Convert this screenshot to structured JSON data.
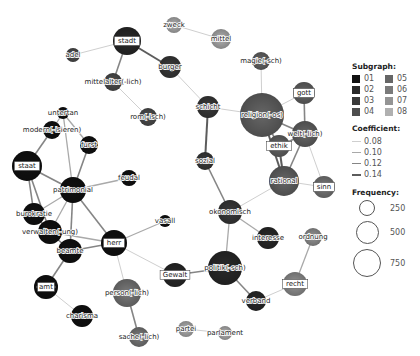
{
  "legend": {
    "subgraph_title": "Subgraph:",
    "subgraphs": [
      {
        "label": "01",
        "color": "#111111"
      },
      {
        "label": "02",
        "color": "#2a2a2a"
      },
      {
        "label": "03",
        "color": "#3a3a3a"
      },
      {
        "label": "04",
        "color": "#4e4e4e"
      },
      {
        "label": "05",
        "color": "#666666"
      },
      {
        "label": "06",
        "color": "#7a7a7a"
      },
      {
        "label": "07",
        "color": "#949494"
      },
      {
        "label": "08",
        "color": "#b0b0b0"
      }
    ],
    "coefficient_title": "Coefficient:",
    "coefficients": [
      {
        "label": "0.08",
        "width": 1,
        "color": "#cfcfcf"
      },
      {
        "label": "0.10",
        "width": 1.3,
        "color": "#a9a9a9"
      },
      {
        "label": "0.12",
        "width": 1.6,
        "color": "#858585"
      },
      {
        "label": "0.14",
        "width": 2,
        "color": "#5c5c5c"
      }
    ],
    "frequency_title": "Frequency:",
    "frequencies": [
      {
        "label": "250",
        "size": 16
      },
      {
        "label": "500",
        "size": 23
      },
      {
        "label": "750",
        "size": 28
      }
    ]
  },
  "nodes": [
    {
      "id": "stadt",
      "label": "stadt",
      "x": 127,
      "y": 41,
      "r": 14,
      "sg": "02",
      "boxed": true
    },
    {
      "id": "adel",
      "label": "adel",
      "x": 73,
      "y": 55,
      "r": 7,
      "sg": "04",
      "boxed": false
    },
    {
      "id": "mittelalter",
      "label": "mittelalter(-lich)",
      "x": 113,
      "y": 82,
      "r": 9,
      "sg": "04",
      "boxed": false
    },
    {
      "id": "burger",
      "label": "burger",
      "x": 170,
      "y": 67,
      "r": 11,
      "sg": "03",
      "boxed": false
    },
    {
      "id": "zweck",
      "label": "zweck",
      "x": 174,
      "y": 25,
      "r": 8,
      "sg": "08",
      "boxed": false
    },
    {
      "id": "mittel",
      "label": "mittel",
      "x": 221,
      "y": 39,
      "r": 10,
      "sg": "08",
      "boxed": false
    },
    {
      "id": "rom",
      "label": "rom(-isch)",
      "x": 148,
      "y": 117,
      "r": 9,
      "sg": "04",
      "boxed": false
    },
    {
      "id": "magie",
      "label": "magie(-sch)",
      "x": 261,
      "y": 61,
      "r": 9,
      "sg": "05",
      "boxed": false
    },
    {
      "id": "gott",
      "label": "gott",
      "x": 304,
      "y": 93,
      "r": 11,
      "sg": "05",
      "boxed": true
    },
    {
      "id": "religion",
      "label": "religion(-os)",
      "x": 262,
      "y": 115,
      "r": 22,
      "sg": "05",
      "boxed": false
    },
    {
      "id": "schicht",
      "label": "schicht",
      "x": 208,
      "y": 107,
      "r": 11,
      "sg": "03",
      "boxed": false
    },
    {
      "id": "welt",
      "label": "welt(-lich)",
      "x": 305,
      "y": 134,
      "r": 13,
      "sg": "05",
      "boxed": false
    },
    {
      "id": "ethik",
      "label": "ethik",
      "x": 279,
      "y": 146,
      "r": 11,
      "sg": "05",
      "boxed": true
    },
    {
      "id": "rational",
      "label": "rational",
      "x": 284,
      "y": 181,
      "r": 15,
      "sg": "05",
      "boxed": false
    },
    {
      "id": "sinn",
      "label": "sinn",
      "x": 324,
      "y": 187,
      "r": 11,
      "sg": "06",
      "boxed": true
    },
    {
      "id": "sozial",
      "label": "sozial",
      "x": 205,
      "y": 161,
      "r": 9,
      "sg": "03",
      "boxed": false
    },
    {
      "id": "okonomisch",
      "label": "okonomisch",
      "x": 230,
      "y": 212,
      "r": 12,
      "sg": "03",
      "boxed": false
    },
    {
      "id": "interesse",
      "label": "interesse",
      "x": 268,
      "y": 238,
      "r": 11,
      "sg": "02",
      "boxed": false
    },
    {
      "id": "ordnung",
      "label": "ordnung",
      "x": 313,
      "y": 237,
      "r": 9,
      "sg": "07",
      "boxed": false
    },
    {
      "id": "recht",
      "label": "recht",
      "x": 295,
      "y": 284,
      "r": 12,
      "sg": "07",
      "boxed": true
    },
    {
      "id": "politik",
      "label": "politik(-sch)",
      "x": 225,
      "y": 268,
      "r": 17,
      "sg": "02",
      "boxed": false
    },
    {
      "id": "verband",
      "label": "verband",
      "x": 256,
      "y": 301,
      "r": 10,
      "sg": "02",
      "boxed": false
    },
    {
      "id": "gewalt",
      "label": "Gewalt",
      "x": 175,
      "y": 275,
      "r": 12,
      "sg": "02",
      "boxed": true
    },
    {
      "id": "partei",
      "label": "partei",
      "x": 186,
      "y": 329,
      "r": 8,
      "sg": "08",
      "boxed": false
    },
    {
      "id": "parlament",
      "label": "parlament",
      "x": 225,
      "y": 333,
      "r": 7,
      "sg": "08",
      "boxed": false
    },
    {
      "id": "untertan",
      "label": "untertan",
      "x": 63,
      "y": 113,
      "r": 6,
      "sg": "01",
      "boxed": false
    },
    {
      "id": "modern",
      "label": "modern(-isieren)",
      "x": 52,
      "y": 130,
      "r": 9,
      "sg": "01",
      "boxed": false
    },
    {
      "id": "furst",
      "label": "furst",
      "x": 89,
      "y": 145,
      "r": 9,
      "sg": "01",
      "boxed": false
    },
    {
      "id": "staat",
      "label": "staat",
      "x": 27,
      "y": 166,
      "r": 15,
      "sg": "01",
      "boxed": true
    },
    {
      "id": "patrimonial",
      "label": "patrimonial",
      "x": 73,
      "y": 190,
      "r": 13,
      "sg": "01",
      "boxed": false
    },
    {
      "id": "feudal",
      "label": "feudal",
      "x": 129,
      "y": 178,
      "r": 8,
      "sg": "01",
      "boxed": false
    },
    {
      "id": "burokratie",
      "label": "burokratie",
      "x": 34,
      "y": 214,
      "r": 11,
      "sg": "01",
      "boxed": false
    },
    {
      "id": "verwalten",
      "label": "verwalten(-ung)",
      "x": 50,
      "y": 232,
      "r": 12,
      "sg": "01",
      "boxed": false
    },
    {
      "id": "vasall",
      "label": "vasall",
      "x": 165,
      "y": 221,
      "r": 6,
      "sg": "01",
      "boxed": false
    },
    {
      "id": "herr",
      "label": "herr",
      "x": 114,
      "y": 243,
      "r": 13,
      "sg": "01",
      "boxed": true
    },
    {
      "id": "beamte",
      "label": "beamte",
      "x": 70,
      "y": 251,
      "r": 12,
      "sg": "01",
      "boxed": false
    },
    {
      "id": "amt",
      "label": "amt",
      "x": 46,
      "y": 287,
      "r": 12,
      "sg": "01",
      "boxed": true
    },
    {
      "id": "charisma",
      "label": "charisma",
      "x": 82,
      "y": 316,
      "r": 11,
      "sg": "01",
      "boxed": false
    },
    {
      "id": "person",
      "label": "person(-lich)",
      "x": 127,
      "y": 293,
      "r": 14,
      "sg": "06",
      "boxed": false
    },
    {
      "id": "sache",
      "label": "sache(-lich)",
      "x": 139,
      "y": 337,
      "r": 10,
      "sg": "06",
      "boxed": false
    }
  ],
  "edges": [
    {
      "s": "stadt",
      "t": "adel",
      "w": 0
    },
    {
      "s": "stadt",
      "t": "burger",
      "w": 3
    },
    {
      "s": "stadt",
      "t": "mittelalter",
      "w": 2
    },
    {
      "s": "mittelalter",
      "t": "rom",
      "w": 0
    },
    {
      "s": "zweck",
      "t": "mittel",
      "w": 0
    },
    {
      "s": "burger",
      "t": "schicht",
      "w": 0
    },
    {
      "s": "schicht",
      "t": "religion",
      "w": 0
    },
    {
      "s": "schicht",
      "t": "sozial",
      "w": 3
    },
    {
      "s": "magie",
      "t": "religion",
      "w": 0
    },
    {
      "s": "religion",
      "t": "gott",
      "w": 0
    },
    {
      "s": "religion",
      "t": "welt",
      "w": 2
    },
    {
      "s": "religion",
      "t": "ethik",
      "w": 2
    },
    {
      "s": "religion",
      "t": "rational",
      "w": 3
    },
    {
      "s": "gott",
      "t": "welt",
      "w": 2
    },
    {
      "s": "welt",
      "t": "ethik",
      "w": 2
    },
    {
      "s": "welt",
      "t": "rational",
      "w": 2
    },
    {
      "s": "welt",
      "t": "sinn",
      "w": 0
    },
    {
      "s": "ethik",
      "t": "rational",
      "w": 3
    },
    {
      "s": "rational",
      "t": "sinn",
      "w": 0
    },
    {
      "s": "rational",
      "t": "okonomisch",
      "w": 0
    },
    {
      "s": "sozial",
      "t": "okonomisch",
      "w": 2
    },
    {
      "s": "okonomisch",
      "t": "interesse",
      "w": 1
    },
    {
      "s": "okonomisch",
      "t": "politik",
      "w": 1
    },
    {
      "s": "politik",
      "t": "gewalt",
      "w": 2
    },
    {
      "s": "politik",
      "t": "verband",
      "w": 2
    },
    {
      "s": "verband",
      "t": "recht",
      "w": 0
    },
    {
      "s": "recht",
      "t": "ordnung",
      "w": 1
    },
    {
      "s": "partei",
      "t": "parlament",
      "w": 0
    },
    {
      "s": "herr",
      "t": "gewalt",
      "w": 0
    },
    {
      "s": "herr",
      "t": "vasall",
      "w": 1
    },
    {
      "s": "herr",
      "t": "person",
      "w": 0
    },
    {
      "s": "herr",
      "t": "patrimonial",
      "w": 2
    },
    {
      "s": "herr",
      "t": "beamte",
      "w": 2
    },
    {
      "s": "herr",
      "t": "verwalten",
      "w": 1
    },
    {
      "s": "person",
      "t": "sache",
      "w": 2
    },
    {
      "s": "untertan",
      "t": "modern",
      "w": 1
    },
    {
      "s": "untertan",
      "t": "furst",
      "w": 1
    },
    {
      "s": "untertan",
      "t": "patrimonial",
      "w": 1
    },
    {
      "s": "modern",
      "t": "staat",
      "w": 2
    },
    {
      "s": "furst",
      "t": "patrimonial",
      "w": 2
    },
    {
      "s": "staat",
      "t": "patrimonial",
      "w": 2
    },
    {
      "s": "staat",
      "t": "burokratie",
      "w": 2
    },
    {
      "s": "staat",
      "t": "verwalten",
      "w": 2
    },
    {
      "s": "patrimonial",
      "t": "feudal",
      "w": 1
    },
    {
      "s": "patrimonial",
      "t": "burokratie",
      "w": 1
    },
    {
      "s": "patrimonial",
      "t": "verwalten",
      "w": 1
    },
    {
      "s": "patrimonial",
      "t": "beamte",
      "w": 2
    },
    {
      "s": "burokratie",
      "t": "verwalten",
      "w": 2
    },
    {
      "s": "verwalten",
      "t": "beamte",
      "w": 2
    },
    {
      "s": "beamte",
      "t": "amt",
      "w": 2
    },
    {
      "s": "amt",
      "t": "charisma",
      "w": 0
    }
  ]
}
